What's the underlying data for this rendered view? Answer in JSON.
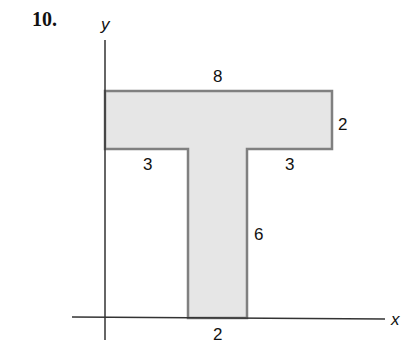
{
  "problem_number": "10.",
  "axes": {
    "x_label": "x",
    "y_label": "y"
  },
  "shape": {
    "name": "T-shaped region",
    "fill": "#e6e6e6",
    "stroke": "#808080",
    "dimensions": {
      "top_width": "8",
      "top_height": "2",
      "left_overhang": "3",
      "right_overhang": "3",
      "stem_height": "6",
      "stem_width": "2"
    }
  }
}
